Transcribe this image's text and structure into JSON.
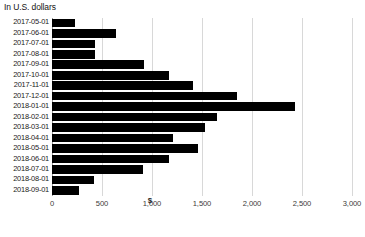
{
  "chart_data": {
    "type": "bar",
    "orientation": "horizontal",
    "title": "In U.S. dollars",
    "subtitle": "",
    "xlabel": "$",
    "ylabel": "",
    "xlim": [
      0,
      3000
    ],
    "xticks": [
      0,
      500,
      1000,
      1500,
      2000,
      2500,
      3000
    ],
    "xtick_labels": [
      "0",
      "500",
      "1,000",
      "1,500",
      "2,000",
      "2,500",
      "3,000"
    ],
    "grid": true,
    "legend": false,
    "bar_color": "#000000",
    "categories": [
      "2017-05-01",
      "2017-06-01",
      "2017-07-01",
      "2017-08-01",
      "2017-09-01",
      "2017-10-01",
      "2017-11-01",
      "2017-12-01",
      "2018-01-01",
      "2018-02-01",
      "2018-03-01",
      "2018-04-01",
      "2018-05-01",
      "2018-06-01",
      "2018-07-01",
      "2018-08-01",
      "2018-09-01"
    ],
    "values": [
      232,
      643,
      431,
      434,
      919,
      1168,
      1411,
      1848,
      2434,
      1653,
      1525,
      1209,
      1461,
      1168,
      912,
      417,
      273
    ]
  }
}
